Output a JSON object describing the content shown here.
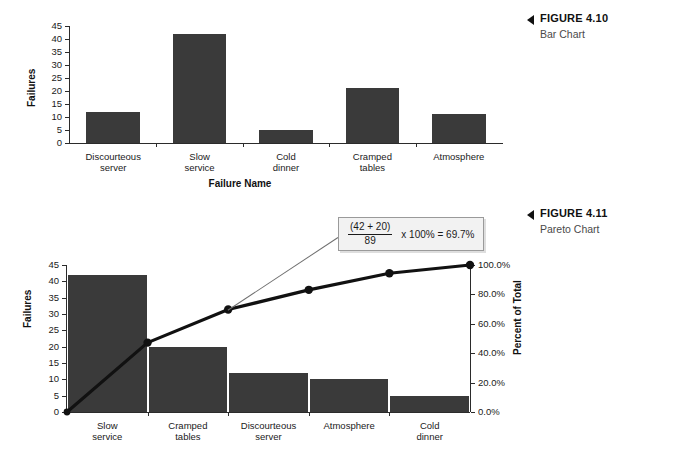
{
  "figures": [
    {
      "label": "FIGURE 4.10",
      "subtitle": "Bar Chart"
    },
    {
      "label": "FIGURE 4.11",
      "subtitle": "Pareto Chart"
    }
  ],
  "chart_data": [
    {
      "type": "bar",
      "title": "",
      "xlabel": "Failure Name",
      "ylabel": "Failures",
      "categories": [
        "Discourteous server",
        "Slow service",
        "Cold dinner",
        "Cramped tables",
        "Atmosphere"
      ],
      "category_lines": [
        [
          "Discourteous",
          "server"
        ],
        [
          "Slow",
          "service"
        ],
        [
          "Cold",
          "dinner"
        ],
        [
          "Cramped",
          "tables"
        ],
        [
          "Atmosphere"
        ]
      ],
      "values": [
        12,
        42,
        5,
        21,
        11
      ],
      "ylim": [
        0,
        45
      ],
      "yticks": [
        0,
        5,
        10,
        15,
        20,
        25,
        30,
        35,
        40,
        45
      ],
      "ytick_labels": [
        "0",
        "5",
        "10",
        "15",
        "20",
        "25",
        "30",
        "35",
        "40",
        "45"
      ],
      "grid": false,
      "legend": "none",
      "bar_color": "#3a3a3a"
    },
    {
      "type": "bar",
      "title": "",
      "xlabel": "Failure Name",
      "ylabel": "Failures",
      "y2label": "Percent of Total",
      "categories": [
        "Slow service",
        "Cramped tables",
        "Discourteous server",
        "Atmosphere",
        "Cold dinner"
      ],
      "category_lines": [
        [
          "Slow",
          "service"
        ],
        [
          "Cramped",
          "tables"
        ],
        [
          "Discourteous",
          "server"
        ],
        [
          "Atmosphere"
        ],
        [
          "Cold",
          "dinner"
        ]
      ],
      "values": [
        42,
        20,
        12,
        10,
        5
      ],
      "ylim": [
        0,
        45
      ],
      "yticks": [
        0,
        5,
        10,
        15,
        20,
        25,
        30,
        35,
        40,
        45
      ],
      "ytick_labels": [
        "0",
        "5",
        "10",
        "15",
        "20",
        "25",
        "30",
        "35",
        "40",
        "45"
      ],
      "y2lim": [
        0,
        100
      ],
      "y2ticks": [
        0,
        20,
        40,
        60,
        80,
        100
      ],
      "y2tick_labels": [
        "0.0%",
        "20.0%",
        "40.0%",
        "60.0%",
        "80.0%",
        "100.0%"
      ],
      "cumulative_percent": [
        0,
        47.2,
        69.7,
        83.1,
        94.4,
        100.0
      ],
      "total": 89,
      "grid": false,
      "legend": "none",
      "bar_color": "#3a3a3a",
      "line_color": "#111111",
      "annotation": {
        "numerator": "(42 + 20)",
        "denominator": "89",
        "rest": "x 100% = 69.7%"
      }
    }
  ]
}
